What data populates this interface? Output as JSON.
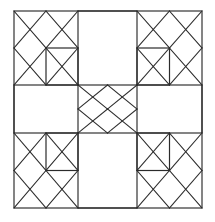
{
  "figure": {
    "background_color": "#ffffff",
    "line_color": "#2b2b2b",
    "canvas": {
      "width": 215,
      "height": 222
    }
  },
  "chart_data": {
    "type": "diagram",
    "xlabel": "",
    "ylabel": "",
    "grid": {
      "columns": 3,
      "rows": 3,
      "x_divisions": [
        14,
        78,
        137,
        202
      ],
      "y_divisions": [
        11,
        85,
        133,
        208
      ]
    },
    "cells": [
      {
        "id": "top-left",
        "row": 0,
        "col": 0,
        "style": "lattice-with-square",
        "lattice_cols": 2,
        "lattice_rows": 2,
        "inner_square": "bottom-right"
      },
      {
        "id": "top-center",
        "row": 0,
        "col": 1,
        "style": "plain-rectangle",
        "lattice_cols": 0,
        "lattice_rows": 0,
        "inner_square": "none"
      },
      {
        "id": "top-right",
        "row": 0,
        "col": 2,
        "style": "lattice-with-square",
        "lattice_cols": 2,
        "lattice_rows": 2,
        "inner_square": "bottom-left"
      },
      {
        "id": "middle-left",
        "row": 1,
        "col": 0,
        "style": "plain-rectangle",
        "lattice_cols": 0,
        "lattice_rows": 0,
        "inner_square": "none"
      },
      {
        "id": "center",
        "row": 1,
        "col": 1,
        "style": "lattice",
        "lattice_cols": 2,
        "lattice_rows": 2,
        "inner_square": "none"
      },
      {
        "id": "middle-right",
        "row": 1,
        "col": 2,
        "style": "plain-rectangle",
        "lattice_cols": 0,
        "lattice_rows": 0,
        "inner_square": "none"
      },
      {
        "id": "bottom-left",
        "row": 2,
        "col": 0,
        "style": "lattice-with-square",
        "lattice_cols": 2,
        "lattice_rows": 2,
        "inner_square": "top-right"
      },
      {
        "id": "bottom-center",
        "row": 2,
        "col": 1,
        "style": "plain-rectangle",
        "lattice_cols": 0,
        "lattice_rows": 0,
        "inner_square": "none"
      },
      {
        "id": "bottom-right",
        "row": 2,
        "col": 2,
        "style": "lattice-with-square",
        "lattice_cols": 2,
        "lattice_rows": 2,
        "inner_square": "top-left"
      }
    ],
    "counts": {
      "plain_rectangles": 4,
      "lattice_blocks": 5,
      "small_squares": 4
    }
  }
}
